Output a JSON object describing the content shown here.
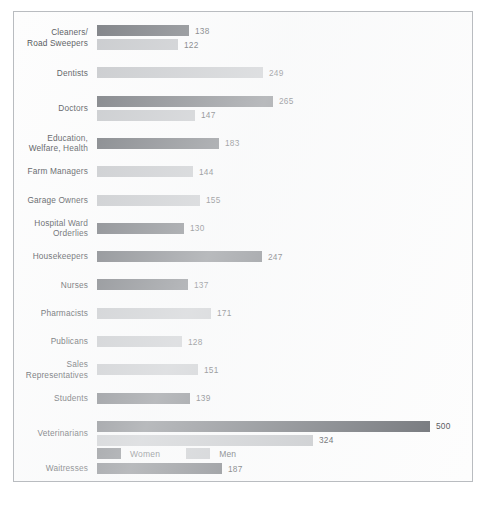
{
  "chart_data": {
    "type": "bar",
    "orientation": "horizontal",
    "title": "",
    "subtitle": "",
    "xlabel": "",
    "ylabel": "",
    "grid": false,
    "xlim": [
      0,
      500
    ],
    "axis_ticks_visible": false,
    "value_labels_shown": true,
    "legend": {
      "position": "bottom-left",
      "entries": [
        {
          "name": "Women",
          "color": "#6d7075"
        },
        {
          "name": "Men",
          "color": "#c3c5c8"
        }
      ]
    },
    "categories": [
      "Cleaners/\nRoad Sweepers",
      "Dentists",
      "Doctors",
      "Education,\nWelfare, Health",
      "Farm Managers",
      "Garage Owners",
      "Hospital Ward\nOrderlies",
      "Housekeepers",
      "Nurses",
      "Pharmacists",
      "Publicans",
      "Sales\nRepresentatives",
      "Students",
      "Veterinarians",
      "Waitresses"
    ],
    "series": [
      {
        "name": "Women",
        "color": "#6d7075",
        "values": [
          138,
          null,
          265,
          183,
          null,
          null,
          130,
          247,
          137,
          null,
          null,
          null,
          139,
          500,
          187
        ]
      },
      {
        "name": "Men",
        "color": "#c3c5c8",
        "values": [
          122,
          249,
          147,
          null,
          144,
          155,
          null,
          null,
          null,
          171,
          128,
          151,
          null,
          324,
          null
        ]
      }
    ],
    "rows": [
      {
        "label": "Cleaners/\nRoad Sweepers",
        "bars": [
          {
            "series": "Women",
            "value": 138,
            "value_label": "138"
          },
          {
            "series": "Men",
            "value": 122,
            "value_label": "122"
          }
        ]
      },
      {
        "label": "Dentists",
        "bars": [
          {
            "series": "Men",
            "value": 249,
            "value_label": "249"
          }
        ]
      },
      {
        "label": "Doctors",
        "bars": [
          {
            "series": "Women",
            "value": 265,
            "value_label": "265"
          },
          {
            "series": "Men",
            "value": 147,
            "value_label": "147"
          }
        ]
      },
      {
        "label": "Education,\nWelfare, Health",
        "bars": [
          {
            "series": "Women",
            "value": 183,
            "value_label": "183"
          }
        ]
      },
      {
        "label": "Farm Managers",
        "bars": [
          {
            "series": "Men",
            "value": 144,
            "value_label": "144"
          }
        ]
      },
      {
        "label": "Garage Owners",
        "bars": [
          {
            "series": "Men",
            "value": 155,
            "value_label": "155"
          }
        ]
      },
      {
        "label": "Hospital Ward\nOrderlies",
        "bars": [
          {
            "series": "Women",
            "value": 130,
            "value_label": "130"
          }
        ]
      },
      {
        "label": "Housekeepers",
        "bars": [
          {
            "series": "Women",
            "value": 247,
            "value_label": "247"
          }
        ]
      },
      {
        "label": "Nurses",
        "bars": [
          {
            "series": "Women",
            "value": 137,
            "value_label": "137"
          }
        ]
      },
      {
        "label": "Pharmacists",
        "bars": [
          {
            "series": "Men",
            "value": 171,
            "value_label": "171"
          }
        ]
      },
      {
        "label": "Publicans",
        "bars": [
          {
            "series": "Men",
            "value": 128,
            "value_label": "128"
          }
        ]
      },
      {
        "label": "Sales\nRepresentatives",
        "bars": [
          {
            "series": "Men",
            "value": 151,
            "value_label": "151"
          }
        ]
      },
      {
        "label": "Students",
        "bars": [
          {
            "series": "Women",
            "value": 139,
            "value_label": "139"
          }
        ]
      },
      {
        "label": "Veterinarians",
        "bars": [
          {
            "series": "Women",
            "value": 500,
            "value_label": "500"
          },
          {
            "series": "Men",
            "value": 324,
            "value_label": "324"
          }
        ]
      },
      {
        "label": "Waitresses",
        "bars": [
          {
            "series": "Women",
            "value": 187,
            "value_label": "187"
          }
        ]
      }
    ]
  },
  "colors": {
    "women": "#6d7075",
    "men": "#c3c5c8",
    "text": "#4c4f53",
    "frame": "#b9bcc0",
    "background": "#fdfdfd"
  }
}
